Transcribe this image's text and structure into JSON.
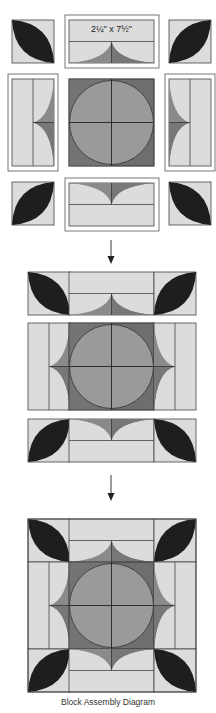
{
  "diagram": {
    "caption": "Block Assembly Diagram",
    "strip_label": "2¼\" x 7½\"",
    "colors": {
      "background": "#ffffff",
      "light": "#dcdcdc",
      "medium": "#9a9a9a",
      "dark": "#6e6e6e",
      "leaf": "#1e1e1e",
      "line": "#444444"
    },
    "stages": [
      {
        "name": "exploded-units",
        "description": "Corner leaf squares, strip units and center circle block laid out separately"
      },
      {
        "name": "joined-rows",
        "description": "Units sewn into three rows"
      },
      {
        "name": "finished-block",
        "description": "Rows sewn into completed block"
      }
    ]
  }
}
